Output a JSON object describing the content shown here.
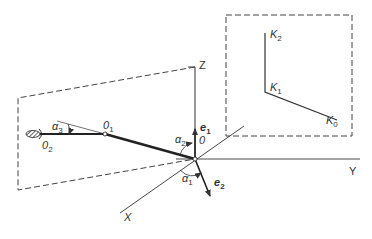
{
  "diagram": {
    "type": "kinematic coordinate diagram",
    "axes": {
      "z": "Z",
      "y": "Y",
      "x": "X"
    },
    "origin": "0",
    "unit_vectors": {
      "e1": {
        "base": "e",
        "sub": "1"
      },
      "e2": {
        "base": "e",
        "sub": "2"
      }
    },
    "angles": {
      "alpha1": {
        "base": "α",
        "sub": "1"
      },
      "alpha2": {
        "base": "α",
        "sub": "2"
      },
      "alpha3": {
        "base": "α",
        "sub": "3"
      }
    },
    "joints": {
      "o1": {
        "base": "0",
        "sub": "1"
      },
      "o2": {
        "base": "0",
        "sub": "2"
      }
    },
    "trajectory_points": {
      "k0": {
        "base": "K",
        "sub": "0"
      },
      "k1": {
        "base": "K",
        "sub": "1"
      },
      "k2": {
        "base": "K",
        "sub": "2"
      }
    },
    "colors": {
      "line": "#333333",
      "dash": "#444444",
      "background": "#ffffff"
    }
  }
}
